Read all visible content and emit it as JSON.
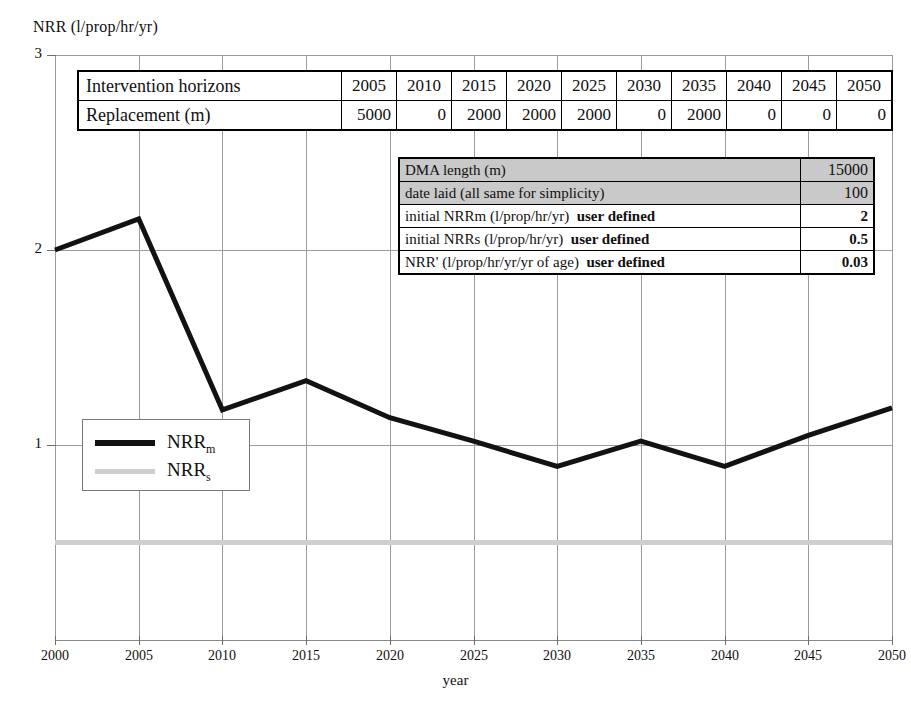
{
  "chart_data": {
    "type": "line",
    "title": "",
    "ylabel": "NRR (l/prop/hr/yr)",
    "xlabel": "year",
    "x": [
      2000,
      2005,
      2010,
      2015,
      2020,
      2025,
      2030,
      2035,
      2040,
      2045,
      2050
    ],
    "xtick_labels": [
      "2000",
      "2005",
      "2010",
      "2015",
      "2020",
      "2025",
      "2030",
      "2035",
      "2040",
      "2045",
      "2050"
    ],
    "ytick_labels": [
      "3",
      "2",
      "1"
    ],
    "xlim": [
      2000,
      2050
    ],
    "ylim": [
      0,
      3
    ],
    "grid": true,
    "legend_position": "inside-left",
    "series": [
      {
        "name": "NRRm",
        "legend_label": "NRR",
        "legend_sub": "m",
        "color": "#121212",
        "values": [
          2.0,
          2.16,
          1.18,
          1.33,
          1.14,
          1.02,
          0.89,
          1.02,
          0.89,
          1.05,
          1.19
        ]
      },
      {
        "name": "NRRs",
        "legend_label": "NRR",
        "legend_sub": "s",
        "color": "#cfcfcf",
        "values": [
          0.5,
          0.5,
          0.5,
          0.5,
          0.5,
          0.5,
          0.5,
          0.5,
          0.5,
          0.5,
          0.5
        ]
      }
    ]
  },
  "intervention_table": {
    "row_headers": [
      "Intervention horizons",
      "Replacement (m)"
    ],
    "years": [
      "2005",
      "2010",
      "2015",
      "2020",
      "2025",
      "2030",
      "2035",
      "2040",
      "2045",
      "2050"
    ],
    "replacement": [
      "5000",
      "0",
      "2000",
      "2000",
      "2000",
      "0",
      "2000",
      "0",
      "0",
      "0"
    ]
  },
  "params_table": {
    "rows": [
      {
        "label": "DMA length (m)",
        "suffix": "",
        "value": "15000",
        "shaded": true
      },
      {
        "label": "date laid (all same for simplicity)",
        "suffix": "",
        "value": "100",
        "shaded": true
      },
      {
        "label": "initial NRRm (l/prop/hr/yr)",
        "suffix": "user defined",
        "value": "2",
        "shaded": false
      },
      {
        "label": "initial NRRs (l/prop/hr/yr)",
        "suffix": "user defined",
        "value": "0.5",
        "shaded": false
      },
      {
        "label": "NRR' (l/prop/hr/yr/yr of age)",
        "suffix": "user defined",
        "value": "0.03",
        "shaded": false
      }
    ]
  }
}
